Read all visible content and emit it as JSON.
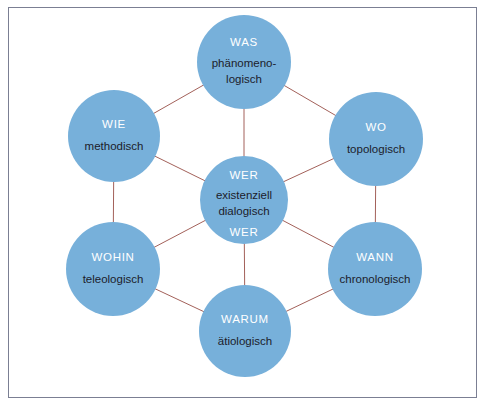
{
  "diagram": {
    "background_color": "#ffffff",
    "frame_border_color": "#7b7f93",
    "circle_fill_color": "#77B0DA",
    "connector_color": "#a3615a",
    "primary_label_color": "#ffffff",
    "secondary_label_color": "#1c1c2b",
    "center_node": {
      "id": "wer",
      "label_top": "WER",
      "description_line1": "existenziell",
      "description_line2": "dialogisch",
      "label_bottom": "WER",
      "cx": 244,
      "cy": 200,
      "r": 44
    },
    "outer_nodes": [
      {
        "id": "was",
        "label": "WAS",
        "description_line1": "phänomeno-",
        "description_line2": "logisch",
        "cx": 244,
        "cy": 62,
        "r": 47
      },
      {
        "id": "wo",
        "label": "WO",
        "description_line1": "topologisch",
        "description_line2": "",
        "cx": 376,
        "cy": 139,
        "r": 47
      },
      {
        "id": "wann",
        "label": "WANN",
        "description_line1": "chronologisch",
        "description_line2": "",
        "cx": 375,
        "cy": 269,
        "r": 47
      },
      {
        "id": "warum",
        "label": "WARUM",
        "description_line1": "ätiologisch",
        "description_line2": "",
        "cx": 245,
        "cy": 331,
        "r": 46
      },
      {
        "id": "wohin",
        "label": "WOHIN",
        "description_line1": "teleologisch",
        "description_line2": "",
        "cx": 113,
        "cy": 269,
        "r": 47
      },
      {
        "id": "wie",
        "label": "WIE",
        "description_line1": "methodisch",
        "description_line2": "",
        "cx": 114,
        "cy": 136,
        "r": 46
      }
    ],
    "connections_ring": [
      [
        "was",
        "wo"
      ],
      [
        "wo",
        "wann"
      ],
      [
        "wann",
        "warum"
      ],
      [
        "warum",
        "wohin"
      ],
      [
        "wohin",
        "wie"
      ],
      [
        "wie",
        "was"
      ]
    ],
    "connections_spokes": [
      [
        "wer",
        "was"
      ],
      [
        "wer",
        "wo"
      ],
      [
        "wer",
        "wann"
      ],
      [
        "wer",
        "warum"
      ],
      [
        "wer",
        "wohin"
      ],
      [
        "wer",
        "wie"
      ]
    ]
  }
}
